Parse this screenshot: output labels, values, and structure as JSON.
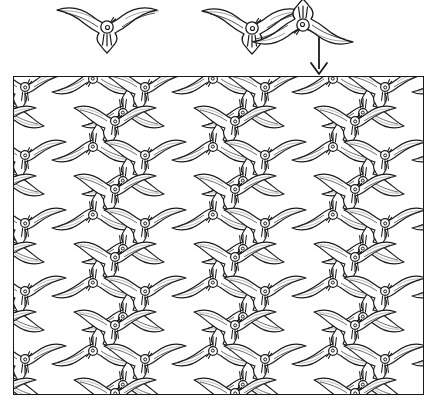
{
  "figure": {
    "background_color": "#ffffff",
    "ink_color": "#1a1a1a",
    "width": 438,
    "height": 407
  },
  "legend": {
    "single_motif": {
      "name": "single bird motif",
      "description": "One outlined bird with swept wings, round head with eye, forked tail",
      "count": 1,
      "orientation": "upright"
    },
    "pair_motif": {
      "name": "interlocking bird pair",
      "description": "Two birds interlocking: one upright, one rotated 180 degrees",
      "count": 2,
      "orientations": [
        "upright",
        "inverted"
      ]
    },
    "arrow": {
      "name": "down-arrow",
      "glyph": "↓",
      "direction": "down",
      "meaning": "the pair tiles the plane below"
    }
  },
  "panel": {
    "name": "tessellation panel",
    "border_color": "#1a1a1a",
    "fill_color": "#ffffff",
    "x": 13,
    "y": 76,
    "width": 411,
    "height": 319
  },
  "tessellation": {
    "type": "plane-filling bird tiling",
    "tile_width": 60,
    "tile_height": 34,
    "columns": 8,
    "rows": 10,
    "row_offset": 30,
    "motif_colors": {
      "outline": "#1a1a1a",
      "fill": "#ffffff",
      "highlight_fill": "#000000"
    },
    "highlight": {
      "name": "solid black bird",
      "count": 1,
      "fill": "#000000",
      "x": 253,
      "y": 172,
      "note": "one tile rendered as a filled silhouette"
    }
  },
  "chart_data": {
    "type": "diagram",
    "elements": [
      {
        "label": "single bird",
        "count": 1
      },
      {
        "label": "interlocking bird pair",
        "count": 2
      },
      {
        "label": "down arrow",
        "count": 1
      },
      {
        "label": "tiled birds in panel",
        "count": 80
      },
      {
        "label": "solid black bird",
        "count": 1
      }
    ]
  }
}
